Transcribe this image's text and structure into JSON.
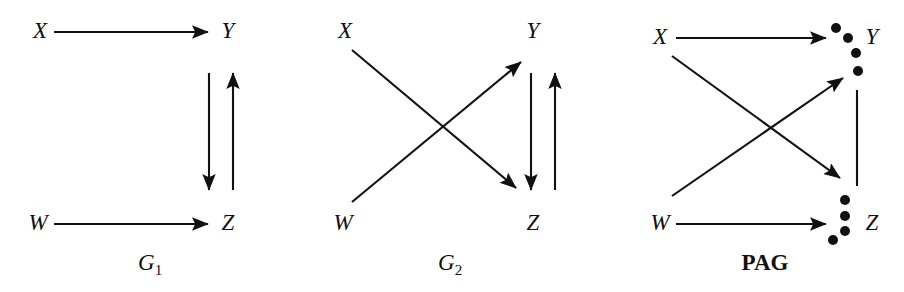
{
  "figure": {
    "width": 904,
    "height": 292,
    "background": "#ffffff",
    "ink": "#111111"
  },
  "panels": [
    {
      "id": "g1",
      "caption": "G",
      "caption_sub": "1",
      "caption_style": "italic",
      "caption_x": 150,
      "caption_y": 262,
      "origin_x": 0,
      "nodes": [
        {
          "name": "X",
          "label": "X",
          "x": 40,
          "y": 30
        },
        {
          "name": "Y",
          "label": "Y",
          "x": 228,
          "y": 30
        },
        {
          "name": "W",
          "label": "W",
          "x": 38,
          "y": 222
        },
        {
          "name": "Z",
          "label": "Z",
          "x": 228,
          "y": 222
        }
      ],
      "edges": [
        {
          "name": "x-to-y",
          "from": "X",
          "to": "Y",
          "kind": "arrow",
          "x1": 54,
          "y1": 32,
          "x2": 208,
          "y2": 32
        },
        {
          "name": "w-to-z",
          "from": "W",
          "to": "Z",
          "kind": "arrow",
          "x1": 54,
          "y1": 224,
          "x2": 208,
          "y2": 224
        },
        {
          "name": "y-to-z",
          "from": "Y",
          "to": "Z",
          "kind": "arrow",
          "x1": 209,
          "y1": 73,
          "x2": 209,
          "y2": 190
        },
        {
          "name": "z-to-y",
          "from": "Z",
          "to": "Y",
          "kind": "arrow",
          "x1": 233,
          "y1": 190,
          "x2": 233,
          "y2": 73
        }
      ],
      "circle_marks": []
    },
    {
      "id": "g2",
      "caption": "G",
      "caption_sub": "2",
      "caption_style": "italic",
      "caption_x": 450,
      "caption_y": 262,
      "origin_x": 0,
      "nodes": [
        {
          "name": "X",
          "label": "X",
          "x": 345,
          "y": 30
        },
        {
          "name": "Y",
          "label": "Y",
          "x": 533,
          "y": 30
        },
        {
          "name": "W",
          "label": "W",
          "x": 343,
          "y": 222
        },
        {
          "name": "Z",
          "label": "Z",
          "x": 533,
          "y": 222
        }
      ],
      "edges": [
        {
          "name": "x-to-z",
          "from": "X",
          "to": "Z",
          "kind": "arrow",
          "x1": 352,
          "y1": 50,
          "x2": 516,
          "y2": 188
        },
        {
          "name": "w-to-y",
          "from": "W",
          "to": "Y",
          "kind": "arrow",
          "x1": 352,
          "y1": 202,
          "x2": 521,
          "y2": 62
        },
        {
          "name": "y-to-z",
          "from": "Y",
          "to": "Z",
          "kind": "arrow",
          "x1": 531,
          "y1": 73,
          "x2": 531,
          "y2": 190
        },
        {
          "name": "z-to-y",
          "from": "Z",
          "to": "Y",
          "kind": "arrow",
          "x1": 555,
          "y1": 190,
          "x2": 555,
          "y2": 73
        }
      ],
      "circle_marks": []
    },
    {
      "id": "pag",
      "caption": "PAG",
      "caption_sub": "",
      "caption_style": "bold",
      "caption_x": 765,
      "caption_y": 262,
      "origin_x": 0,
      "nodes": [
        {
          "name": "X",
          "label": "X",
          "x": 660,
          "y": 36
        },
        {
          "name": "Y",
          "label": "Y",
          "x": 872,
          "y": 36
        },
        {
          "name": "W",
          "label": "W",
          "x": 660,
          "y": 222
        },
        {
          "name": "Z",
          "label": "Z",
          "x": 872,
          "y": 222
        }
      ],
      "edges": [
        {
          "name": "x-to-y",
          "from": "X",
          "to": "Y",
          "kind": "arrow",
          "x1": 676,
          "y1": 38,
          "x2": 826,
          "y2": 38
        },
        {
          "name": "x-to-z",
          "from": "X",
          "to": "Z",
          "kind": "arrow",
          "x1": 672,
          "y1": 56,
          "x2": 840,
          "y2": 178
        },
        {
          "name": "w-to-y",
          "from": "W",
          "to": "Y",
          "kind": "arrow",
          "x1": 672,
          "y1": 196,
          "x2": 843,
          "y2": 78
        },
        {
          "name": "w-to-z",
          "from": "W",
          "to": "Z",
          "kind": "arrow",
          "x1": 676,
          "y1": 224,
          "x2": 826,
          "y2": 224
        },
        {
          "name": "y-to-z-undirected",
          "from": "Y",
          "to": "Z",
          "kind": "line",
          "x1": 857,
          "y1": 90,
          "x2": 857,
          "y2": 186
        }
      ],
      "circle_marks": [
        {
          "name": "circle-endpoint-y-1",
          "cx": 836,
          "cy": 28,
          "r": 5
        },
        {
          "name": "circle-endpoint-y-2",
          "cx": 848,
          "cy": 38,
          "r": 5
        },
        {
          "name": "circle-endpoint-y-3",
          "cx": 856,
          "cy": 53,
          "r": 5
        },
        {
          "name": "circle-endpoint-y-4",
          "cx": 858,
          "cy": 71,
          "r": 5
        },
        {
          "name": "circle-endpoint-z-1",
          "cx": 845,
          "cy": 200,
          "r": 5
        },
        {
          "name": "circle-endpoint-z-2",
          "cx": 845,
          "cy": 216,
          "r": 5
        },
        {
          "name": "circle-endpoint-z-3",
          "cx": 845,
          "cy": 231,
          "r": 5
        },
        {
          "name": "circle-endpoint-z-4",
          "cx": 833,
          "cy": 240,
          "r": 5
        }
      ]
    }
  ]
}
